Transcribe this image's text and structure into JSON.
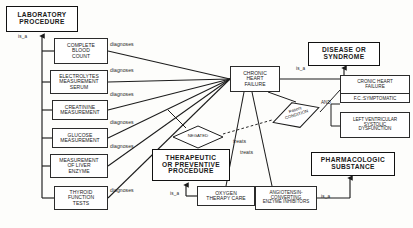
{
  "diagram": {
    "type": "semantic-network",
    "semantic_types": [
      {
        "id": "laboratory-procedure",
        "label": "LABORATORY\nPROCEDURE",
        "x": 6,
        "y": 6,
        "w": 72,
        "h": 26
      },
      {
        "id": "disease-or-syndrome",
        "label": "DISEASE OR\nSYNDROME",
        "x": 308,
        "y": 42,
        "w": 72,
        "h": 24
      },
      {
        "id": "therapeutic-or-preventive-procedure",
        "label": "THERAPEUTIC\nOR PREVENTIVE\nPROCEDURE",
        "x": 152,
        "y": 149,
        "w": 78,
        "h": 32
      },
      {
        "id": "pharmacologic-substance",
        "label": "PHARMACOLOGIC\nSUBSTANCE",
        "x": 311,
        "y": 152,
        "w": 84,
        "h": 24
      }
    ],
    "instances": [
      {
        "id": "complete-blood-count",
        "label": "COMPLETE\nBLOOD\nCOUNT",
        "x": 54,
        "y": 38,
        "w": 54,
        "h": 26
      },
      {
        "id": "electrolytes-measurement-serum",
        "label": "ELECTROLYTES\nMEASUREMENT\nSERUM",
        "x": 50,
        "y": 70,
        "w": 58,
        "h": 24
      },
      {
        "id": "creatinine-measurement",
        "label": "CREATININE\nMEASUREMENT",
        "x": 52,
        "y": 100,
        "w": 56,
        "h": 20
      },
      {
        "id": "glucose-measurement",
        "label": "GLUCOSE\nMEASUREMENT",
        "x": 52,
        "y": 128,
        "w": 56,
        "h": 20
      },
      {
        "id": "measurement-of-liver-enzyme",
        "label": "MEASUREMENT\nOF LIVER\nENZYME",
        "x": 50,
        "y": 154,
        "w": 58,
        "h": 24
      },
      {
        "id": "thyroid-function-tests",
        "label": "THYROID\nFUNCTION\nTESTS",
        "x": 54,
        "y": 186,
        "w": 54,
        "h": 24
      },
      {
        "id": "chronic-heart-failure",
        "label": "CHRONIC\nHEART\nFAILURE",
        "x": 230,
        "y": 66,
        "w": 50,
        "h": 26
      },
      {
        "id": "oxygen-therapy-care",
        "label": "OXYGEN\nTHERAPY CARE",
        "x": 197,
        "y": 186,
        "w": 58,
        "h": 20
      },
      {
        "id": "angiotensin-converting-enzyme-inhibitors",
        "label": "ANGIOTENSIN-\nCONVERTING\nENZYME INHIBITORS",
        "x": 255,
        "y": 186,
        "w": 62,
        "h": 24
      }
    ],
    "detail_nodes": [
      {
        "id": "chronic-heart-failure-fc",
        "label_top": "CRONIC HEART\nFAILURE",
        "label_bottom": "F.C.:SYMPTOMATIC",
        "x": 340,
        "y": 75,
        "w": 70,
        "h": 28
      },
      {
        "id": "left-ventricular-systolic-dysfunction",
        "label": "LEFT VENTRICULAR\nSYSTOLIC\nDYSFUNCTION",
        "x": 340,
        "y": 112,
        "w": 70,
        "h": 26
      }
    ],
    "diamonds": [
      {
        "id": "negated",
        "label": "NEGATED",
        "cx": 198,
        "cy": 137,
        "rx": 25,
        "ry": 11,
        "rotation": 0
      },
      {
        "id": "patient-condition",
        "label": "Patient\nCONDITION",
        "cx": 296,
        "cy": 115,
        "rx": 24,
        "ry": 13,
        "rotation": -18
      }
    ],
    "operators": [
      {
        "id": "and-operator",
        "label": "AND",
        "x": 321,
        "y": 103
      }
    ],
    "edge_labels": [
      {
        "id": "diagnoses-1",
        "label": "diagnoses",
        "x": 110,
        "y": 44
      },
      {
        "id": "diagnoses-2",
        "label": "diagnoses",
        "x": 110,
        "y": 70
      },
      {
        "id": "diagnoses-3",
        "label": "diagnoses",
        "x": 110,
        "y": 94
      },
      {
        "id": "diagnoses-4",
        "label": "diagnoses",
        "x": 110,
        "y": 122
      },
      {
        "id": "diagnoses-5",
        "label": "diagnoses",
        "x": 110,
        "y": 146
      },
      {
        "id": "diagnoses-6",
        "label": "diagnoses",
        "x": 110,
        "y": 190
      },
      {
        "id": "treats-1",
        "label": "treats",
        "x": 233,
        "y": 141
      },
      {
        "id": "treats-2",
        "label": "treats",
        "x": 240,
        "y": 152
      },
      {
        "id": "is-a-top-right",
        "label": "is_a",
        "x": 296,
        "y": 68
      }
    ],
    "isa_labels": [
      {
        "id": "is-a-laboratory-procedure",
        "label": "is_a",
        "x": 18,
        "y": 36
      },
      {
        "id": "is-a-therapeutic-procedure",
        "label": "is_a",
        "x": 170,
        "y": 190
      },
      {
        "id": "is-a-pharmacologic-substance",
        "label": "is_a",
        "x": 321,
        "y": 193
      }
    ]
  }
}
